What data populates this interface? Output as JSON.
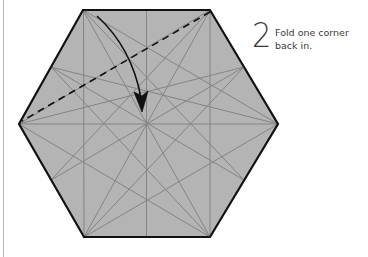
{
  "step": {
    "number": "2",
    "instruction_line1": "Fold one corner",
    "instruction_line2": "back in."
  },
  "colors": {
    "paper": "#b4b4b4",
    "outline": "#111111",
    "crease": "#848484",
    "fold_line": "#111111",
    "arrow": "#111111",
    "margin_line": "#b8b8b8"
  },
  "diagram": {
    "shape": "hexagon",
    "vertices": [
      [
        83,
        10
      ],
      [
        210,
        10
      ],
      [
        278,
        124
      ],
      [
        210,
        237
      ],
      [
        84,
        237
      ],
      [
        19,
        124
      ]
    ],
    "center": [
      146,
      124
    ],
    "valley_fold_line": {
      "from": [
        210,
        12
      ],
      "to": [
        22,
        121
      ],
      "style": "dashed"
    },
    "arrow": {
      "from": [
        98,
        16
      ],
      "to": [
        142,
        110
      ],
      "direction": "down-curved"
    }
  }
}
